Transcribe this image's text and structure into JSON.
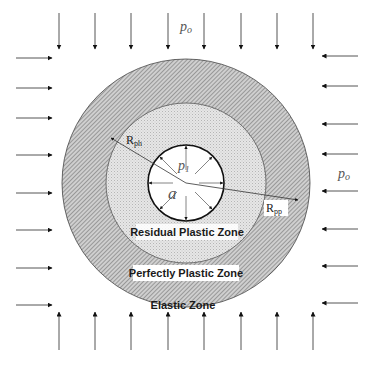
{
  "labels": {
    "outer_pressure_top": "p",
    "outer_pressure_top_sub": "o",
    "outer_pressure_right": "p",
    "outer_pressure_right_sub": "o",
    "inner_pressure": "p",
    "inner_pressure_sub": "1",
    "cavity_radius": "a",
    "r_ph": "R",
    "r_ph_sub": "ph",
    "r_pp": "R",
    "r_pp_sub": "pp",
    "residual_zone": "Residual Plastic Zone",
    "perfect_zone": "Perfectly Plastic Zone",
    "elastic_zone": "Elastic Zone"
  },
  "colors": {
    "outer_ring_hatch": "#8a8a8a",
    "inner_ring_dots": "#bdbdbd",
    "arrow": "#333333",
    "stroke": "#222222"
  },
  "geometry": {
    "center": [
      186,
      183
    ],
    "outer_radius": 124,
    "middle_radius": 80,
    "cavity_radius": 38,
    "boundary_arrow_positions": [
      59,
      95,
      131,
      168,
      204,
      241,
      277,
      313
    ],
    "side_arrow_positions": [
      58,
      88,
      118,
      155,
      193,
      230,
      268,
      305
    ]
  }
}
